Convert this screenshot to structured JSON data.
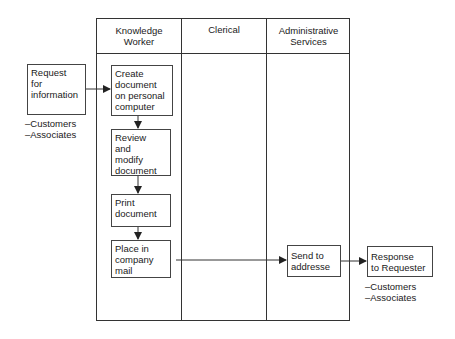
{
  "diagram": {
    "type": "swimlane-flowchart",
    "lanes": [
      {
        "id": "knowledge-worker",
        "label": "Knowledge\nWorker"
      },
      {
        "id": "clerical",
        "label": "Clerical"
      },
      {
        "id": "administrative-services",
        "label": "Administrative\nServices"
      }
    ],
    "external": {
      "request": {
        "label": "Request\nfor\ninformation",
        "notes": "–Customers\n–Associates"
      },
      "response": {
        "label": "Response\nto Requester",
        "notes": "–Customers\n–Associates"
      }
    },
    "steps": [
      {
        "id": "create",
        "lane": "knowledge-worker",
        "label": "Create\ndocument\non personal\ncomputer"
      },
      {
        "id": "review",
        "lane": "knowledge-worker",
        "label": "Review\nand\nmodify\ndocument"
      },
      {
        "id": "print",
        "lane": "knowledge-worker",
        "label": "Print\ndocument"
      },
      {
        "id": "place",
        "lane": "knowledge-worker",
        "label": "Place in\ncompany\nmail"
      },
      {
        "id": "send",
        "lane": "administrative-services",
        "label": "Send to\naddresse"
      }
    ],
    "edges": [
      {
        "from": "request",
        "to": "create"
      },
      {
        "from": "create",
        "to": "review"
      },
      {
        "from": "review",
        "to": "print"
      },
      {
        "from": "print",
        "to": "place"
      },
      {
        "from": "place",
        "to": "send"
      },
      {
        "from": "send",
        "to": "response"
      }
    ],
    "colors": {
      "line": "#333333",
      "text": "#1a1a1a",
      "background": "#ffffff"
    }
  }
}
